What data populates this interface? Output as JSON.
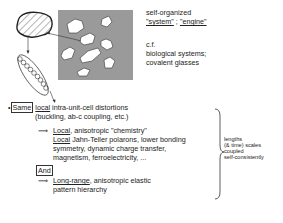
{
  "diagram": {
    "right_top": {
      "line1": "self-organized",
      "system_word": "\"system\"",
      "separator": " ; ",
      "engine_word": "\"engine\"",
      "cf": "c.f.",
      "bio": "biological systems;",
      "glass": "covalent glasses"
    },
    "bullet": {
      "marker": "•",
      "same_box": "Same",
      "local_word": "local",
      "rest": " intra-unit-cell distortions",
      "line2": "(buckling, ab-c coupling, etc.)"
    },
    "implication1": {
      "arrow": "⟹",
      "local1": "Local",
      "rest1": ", anisotropic \"chemistry\"",
      "local2": "Local",
      "rest2": " Jahn-Teller polarons, lower bonding",
      "line3": "symmetry, dynamic charge transfer,",
      "line4": "magnetism, ferroelectricity, ..."
    },
    "and_box": "And",
    "implication2": {
      "arrow": "⟹",
      "longrange": "Long-range",
      "rest": ", anisotropic elastic",
      "line2": "pattern hierarchy"
    },
    "brace_note": {
      "line1": "lengths",
      "line2": "(& time) scales",
      "line3": "coupled",
      "line4": "self-consistently"
    },
    "colors": {
      "gray_matrix": "#9a9a9a",
      "ink": "#222222"
    }
  }
}
